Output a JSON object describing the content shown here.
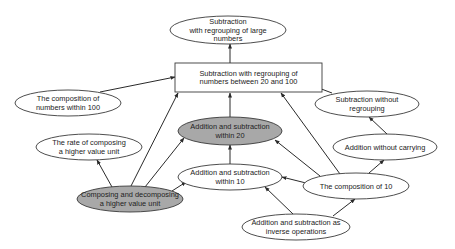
{
  "colors": {
    "stroke": "#3a3a3a",
    "plain_fill": "#ffffff",
    "highlight_fill": "#a8a8a8",
    "text": "#222222"
  },
  "nodes": [
    {
      "id": "sub_large",
      "shape": "ellipse",
      "fill": "plain",
      "cx": 228,
      "cy": 30,
      "rx": 58,
      "ry": 14,
      "lines": [
        "Subtraction",
        "with regrouping of large",
        "numbers"
      ]
    },
    {
      "id": "sub_20_100",
      "shape": "rect",
      "fill": "plain",
      "x": 175,
      "y": 63,
      "w": 147,
      "h": 29,
      "lines": [
        "Subtraction with regrouping of",
        "numbers between 20 and 100"
      ]
    },
    {
      "id": "comp_100",
      "shape": "ellipse",
      "fill": "plain",
      "cx": 68,
      "cy": 103,
      "rx": 53,
      "ry": 13,
      "lines": [
        "The composition of",
        "numbers within 100"
      ]
    },
    {
      "id": "add_sub_20",
      "shape": "ellipse",
      "fill": "gray",
      "cx": 230,
      "cy": 131,
      "rx": 52,
      "ry": 14,
      "lines": [
        "Addition and subtraction",
        "within 20"
      ]
    },
    {
      "id": "sub_no_regroup",
      "shape": "ellipse",
      "fill": "plain",
      "cx": 367,
      "cy": 104,
      "rx": 52,
      "ry": 13,
      "lines": [
        "Subtraction without",
        "regrouping"
      ]
    },
    {
      "id": "add_no_carry",
      "shape": "ellipse",
      "fill": "plain",
      "cx": 385,
      "cy": 147,
      "rx": 52,
      "ry": 13,
      "lines": [
        "Addition without carrying"
      ]
    },
    {
      "id": "rate_composing",
      "shape": "ellipse",
      "fill": "plain",
      "cx": 89,
      "cy": 147,
      "rx": 53,
      "ry": 13,
      "lines": [
        "The rate of composing",
        "a higher value unit"
      ]
    },
    {
      "id": "add_sub_10",
      "shape": "ellipse",
      "fill": "plain",
      "cx": 230,
      "cy": 177,
      "rx": 52,
      "ry": 13,
      "lines": [
        "Addition and subtraction",
        "within 10"
      ]
    },
    {
      "id": "comp_10",
      "shape": "ellipse",
      "fill": "plain",
      "cx": 356,
      "cy": 186,
      "rx": 53,
      "ry": 13,
      "lines": [
        "The composition of 10"
      ]
    },
    {
      "id": "composing_decomposing",
      "shape": "ellipse",
      "fill": "gray",
      "cx": 130,
      "cy": 199,
      "rx": 53,
      "ry": 13,
      "lines": [
        "Composing and decomposing",
        "a higher value unit"
      ]
    },
    {
      "id": "inverse_ops",
      "shape": "ellipse",
      "fill": "plain",
      "cx": 296,
      "cy": 227,
      "rx": 54,
      "ry": 13,
      "lines": [
        "Addition and subtraction as",
        "inverse operations"
      ]
    }
  ],
  "edges": [
    {
      "from": "sub_20_100",
      "to": "sub_large",
      "x1": 230,
      "y1": 63,
      "x2": 230,
      "y2": 44
    },
    {
      "from": "comp_100",
      "to": "sub_20_100",
      "x1": 100,
      "y1": 92,
      "x2": 175,
      "y2": 77
    },
    {
      "from": "sub_no_regroup",
      "to": "sub_20_100",
      "x1": 332,
      "y1": 93,
      "x2": 287,
      "y2": 76
    },
    {
      "from": "add_sub_20",
      "to": "sub_20_100",
      "x1": 230,
      "y1": 117,
      "x2": 230,
      "y2": 93
    },
    {
      "from": "composing_decomposing",
      "to": "sub_20_100",
      "x1": 131,
      "y1": 186,
      "x2": 178,
      "y2": 93
    },
    {
      "from": "comp_10",
      "to": "sub_20_100",
      "x1": 340,
      "y1": 174,
      "x2": 281,
      "y2": 93
    },
    {
      "from": "add_no_carry",
      "to": "sub_no_regroup",
      "x1": 387,
      "y1": 134,
      "x2": 369,
      "y2": 117
    },
    {
      "from": "comp_10",
      "to": "add_no_carry",
      "x1": 369,
      "y1": 173,
      "x2": 384,
      "y2": 160
    },
    {
      "from": "add_sub_10",
      "to": "add_sub_20",
      "x1": 230,
      "y1": 164,
      "x2": 230,
      "y2": 145
    },
    {
      "from": "comp_10",
      "to": "add_sub_20",
      "x1": 320,
      "y1": 176,
      "x2": 275,
      "y2": 140
    },
    {
      "from": "composing_decomposing",
      "to": "add_sub_20",
      "x1": 145,
      "y1": 187,
      "x2": 184,
      "y2": 138
    },
    {
      "from": "composing_decomposing",
      "to": "rate_composing",
      "x1": 112,
      "y1": 187,
      "x2": 97,
      "y2": 160
    },
    {
      "from": "composing_decomposing",
      "to": "add_sub_10",
      "x1": 172,
      "y1": 191,
      "x2": 186,
      "y2": 182
    },
    {
      "from": "comp_10",
      "to": "add_sub_10",
      "x1": 306,
      "y1": 183,
      "x2": 282,
      "y2": 177
    },
    {
      "from": "inverse_ops",
      "to": "add_sub_10",
      "x1": 293,
      "y1": 214,
      "x2": 265,
      "y2": 187
    },
    {
      "from": "inverse_ops",
      "to": "comp_10",
      "x1": 333,
      "y1": 216,
      "x2": 355,
      "y2": 199
    }
  ]
}
